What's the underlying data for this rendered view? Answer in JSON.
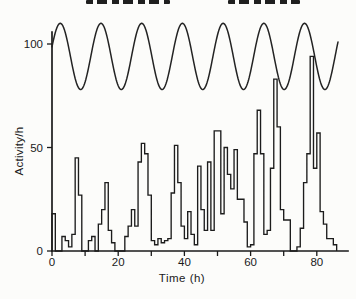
{
  "figure": {
    "y_axis_title": "Activity/h",
    "x_axis_title": "Time (h)"
  },
  "chart_data": {
    "type": "line",
    "title": "",
    "xlabel": "Time (h)",
    "ylabel": "Activity/h",
    "xlim": [
      0,
      89
    ],
    "ylim": [
      0,
      112
    ],
    "grid": false,
    "legend": "none",
    "ink_color": "#1a1a1a",
    "background_color": "#fcfcfa",
    "x_ticks_labeled": [
      0,
      20,
      40,
      60,
      80
    ],
    "x_ticks_minor": [
      10,
      30,
      50,
      70
    ],
    "y_ticks": [
      0,
      50,
      100
    ],
    "series": [
      {
        "name": "sinusoidal-cycle",
        "style": "smooth-line",
        "model": {
          "mean": 94,
          "amplitude": 16,
          "period_h": 12.3,
          "peak_t": 2.5,
          "t_start": 0,
          "t_end": 86.5
        }
      },
      {
        "name": "activity-histogram",
        "style": "step-outline",
        "steps": [
          [
            0,
            18
          ],
          [
            1,
            0
          ],
          [
            3,
            7
          ],
          [
            4,
            5
          ],
          [
            5,
            2
          ],
          [
            6,
            8
          ],
          [
            7,
            45
          ],
          [
            8,
            27
          ],
          [
            9,
            0
          ],
          [
            11,
            5
          ],
          [
            12,
            7
          ],
          [
            13,
            0
          ],
          [
            14,
            13
          ],
          [
            15,
            20
          ],
          [
            16,
            33
          ],
          [
            17,
            10
          ],
          [
            18,
            4
          ],
          [
            19,
            0
          ],
          [
            22,
            7
          ],
          [
            23,
            12
          ],
          [
            24,
            20
          ],
          [
            25,
            12
          ],
          [
            26,
            43
          ],
          [
            27,
            52
          ],
          [
            28,
            47
          ],
          [
            29,
            27
          ],
          [
            30,
            5
          ],
          [
            31,
            3
          ],
          [
            32,
            6
          ],
          [
            33,
            4
          ],
          [
            34,
            5
          ],
          [
            35,
            6
          ],
          [
            36,
            28
          ],
          [
            37,
            51
          ],
          [
            38,
            33
          ],
          [
            39,
            12
          ],
          [
            40,
            6
          ],
          [
            41,
            19
          ],
          [
            42,
            8
          ],
          [
            43,
            3
          ],
          [
            44,
            41
          ],
          [
            45,
            20
          ],
          [
            46,
            10
          ],
          [
            47,
            43
          ],
          [
            48,
            10
          ],
          [
            49,
            58
          ],
          [
            51,
            18
          ],
          [
            52,
            50
          ],
          [
            53,
            37
          ],
          [
            54,
            30
          ],
          [
            55,
            49
          ],
          [
            56,
            25
          ],
          [
            58,
            14
          ],
          [
            59,
            2
          ],
          [
            60,
            3
          ],
          [
            61,
            47
          ],
          [
            62,
            68
          ],
          [
            63,
            47
          ],
          [
            64,
            8
          ],
          [
            65,
            10
          ],
          [
            66,
            40
          ],
          [
            67,
            83
          ],
          [
            68,
            60
          ],
          [
            69,
            20
          ],
          [
            70,
            15
          ],
          [
            72,
            0
          ],
          [
            74,
            2
          ],
          [
            75,
            11
          ],
          [
            76,
            33
          ],
          [
            77,
            47
          ],
          [
            78,
            94
          ],
          [
            79,
            40
          ],
          [
            80,
            57
          ],
          [
            81,
            19
          ],
          [
            82,
            13
          ],
          [
            83,
            6
          ],
          [
            85,
            3
          ],
          [
            86,
            0
          ]
        ]
      }
    ],
    "layout": {
      "x0_px": 52,
      "y0_px": 251,
      "px_per_h": 3.31,
      "px_per_unit": 2.07,
      "axis_top_px": 32,
      "axis_right_px": 348,
      "tick_len_px": 5
    }
  }
}
